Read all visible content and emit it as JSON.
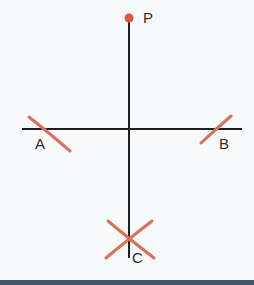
{
  "diagram": {
    "colors": {
      "line": "#1e1e1e",
      "arc": "#d9715a",
      "point": "#e0553e",
      "bar": "#3f5766"
    },
    "points": [
      {
        "id": "P",
        "label": "P",
        "x": 129,
        "y": 18
      },
      {
        "id": "A",
        "label": "A",
        "x": 45,
        "y": 129
      },
      {
        "id": "B",
        "label": "B",
        "x": 215,
        "y": 129
      },
      {
        "id": "C",
        "label": "C",
        "x": 129,
        "y": 239
      }
    ]
  }
}
